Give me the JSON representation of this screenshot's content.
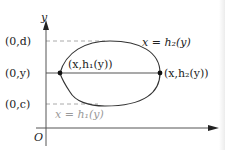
{
  "diagram": {
    "axes": {
      "x_label": "x",
      "y_label": "y",
      "origin_label": "O"
    },
    "y_ticks": [
      {
        "label": "(0,d)",
        "style": "dashed"
      },
      {
        "label": "(0,y)",
        "style": "solid"
      },
      {
        "label": "(0,c)",
        "style": "dashed"
      }
    ],
    "points": [
      {
        "label": "(x,h₁(y))",
        "position": "left"
      },
      {
        "label": "(x,h₂(y))",
        "position": "right"
      }
    ],
    "curves": [
      {
        "label": "x = h₂(y)",
        "side": "right"
      },
      {
        "label": "x = h₁(y)",
        "side": "left"
      }
    ],
    "colors": {
      "stroke": "#333333",
      "dashed": "#aaaaaa",
      "label_grey": "#9a9a9a"
    }
  }
}
